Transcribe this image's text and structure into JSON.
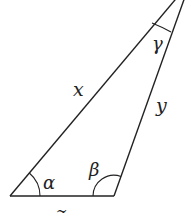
{
  "diagram": {
    "type": "triangle",
    "colors": {
      "stroke": "#222222",
      "background": "#ffffff"
    },
    "sides": {
      "left": "x",
      "right": "y",
      "bottom": "z"
    },
    "angles": {
      "bottom_left": "α",
      "bottom_right": "β",
      "top": "γ"
    }
  }
}
